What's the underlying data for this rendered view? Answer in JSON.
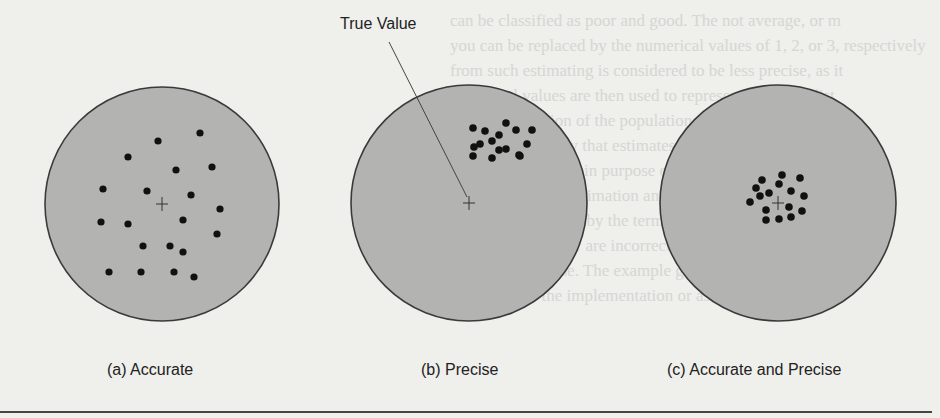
{
  "figure": {
    "annotation": "True Value",
    "panels": [
      {
        "id": "a",
        "caption": "(a) Accurate",
        "center": [
          162,
          204
        ],
        "radius": 117,
        "dots": [
          [
            158,
            141
          ],
          [
            200,
            133
          ],
          [
            128,
            157
          ],
          [
            176,
            170
          ],
          [
            212,
            167
          ],
          [
            103,
            189
          ],
          [
            147,
            191
          ],
          [
            191,
            195
          ],
          [
            220,
            209
          ],
          [
            101,
            222
          ],
          [
            128,
            224
          ],
          [
            183,
            220
          ],
          [
            217,
            234
          ],
          [
            143,
            246
          ],
          [
            170,
            246
          ],
          [
            183,
            252
          ],
          [
            109,
            272
          ],
          [
            141,
            272
          ],
          [
            174,
            272
          ],
          [
            194,
            277
          ]
        ]
      },
      {
        "id": "b",
        "caption": "(b) Precise",
        "center": [
          469,
          203
        ],
        "radius": 118,
        "dots": [
          [
            506,
            123
          ],
          [
            473,
            128
          ],
          [
            516,
            130
          ],
          [
            485,
            131
          ],
          [
            532,
            130
          ],
          [
            499,
            135
          ],
          [
            492,
            141
          ],
          [
            480,
            144
          ],
          [
            527,
            144
          ],
          [
            474,
            147
          ],
          [
            506,
            149
          ],
          [
            499,
            150
          ],
          [
            519,
            155
          ],
          [
            473,
            156
          ],
          [
            492,
            158
          ],
          [
            520,
            156
          ]
        ]
      },
      {
        "id": "c",
        "caption": "(c) Accurate and Precise",
        "center": [
          778,
          203
        ],
        "radius": 118,
        "dots": [
          [
            782,
            175
          ],
          [
            800,
            178
          ],
          [
            762,
            180
          ],
          [
            779,
            184
          ],
          [
            756,
            188
          ],
          [
            791,
            191
          ],
          [
            769,
            193
          ],
          [
            760,
            196
          ],
          [
            804,
            196
          ],
          [
            750,
            202
          ],
          [
            789,
            207
          ],
          [
            766,
            210
          ],
          [
            802,
            211
          ],
          [
            766,
            220
          ],
          [
            779,
            219
          ],
          [
            791,
            217
          ]
        ]
      }
    ],
    "colors": {
      "target_fill": "#b3b3b1",
      "target_stroke": "#3a3a3a",
      "dot": "#111111",
      "background": "#efefec"
    }
  },
  "background_text": [
    "can be classified as poor and good. The not average, or m",
    "you can be replaced by the numerical values of 1, 2, or 3, respectively",
    "from such estimating is considered to be less precise, as it",
    "numerical values are then used to represent a certain dist",
    "of the distribution of the population.",
    "It is more likely that estimates, indicators, or other va",
    "representing the main purpose of estimation, if the error is",
    "are judged in the estimation and directly linked",
    "the error is affected by the terms of the process.",
    "correctly spelled or are incorrectly spelled; the answers of q",
    "right or F for false. The example given is a true",
    "references to the implementation or assignment of the"
  ]
}
